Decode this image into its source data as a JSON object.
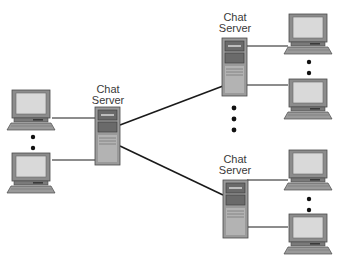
{
  "diagram": {
    "type": "network-topology",
    "colors": {
      "line": "#1a1a1a",
      "device_body": "#8c8c8c",
      "device_light": "#d9d9d9",
      "device_dark": "#5a5a5a",
      "dot": "#111111"
    },
    "servers": [
      {
        "id": "left",
        "label_line1": "Chat",
        "label_line2": "Server"
      },
      {
        "id": "top-right",
        "label_line1": "Chat",
        "label_line2": "Server"
      },
      {
        "id": "bottom-right",
        "label_line1": "Chat",
        "label_line2": "Server"
      }
    ],
    "clients": [
      {
        "id": "left-top",
        "server": "left"
      },
      {
        "id": "left-bottom",
        "server": "left"
      },
      {
        "id": "top-right-top",
        "server": "top-right"
      },
      {
        "id": "top-right-bottom",
        "server": "top-right"
      },
      {
        "id": "bottom-right-top",
        "server": "bottom-right"
      },
      {
        "id": "bottom-right-bottom",
        "server": "bottom-right"
      }
    ],
    "links": [
      {
        "from": "left",
        "to": "top-right"
      },
      {
        "from": "left",
        "to": "bottom-right"
      }
    ],
    "ellipses": [
      {
        "id": "left-clients",
        "dots": 2
      },
      {
        "id": "top-right-clients",
        "dots": 2
      },
      {
        "id": "bottom-right-clients",
        "dots": 2
      },
      {
        "id": "between-servers",
        "dots": 3
      }
    ]
  }
}
